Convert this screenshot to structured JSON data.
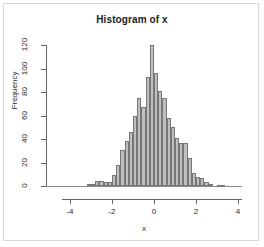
{
  "chart_data": {
    "type": "bar",
    "title": "Histogram of x",
    "xlabel": "x",
    "ylabel": "Frequency",
    "grid": false,
    "legend": "none",
    "xlim": [
      -4,
      4
    ],
    "ylim": [
      0,
      120
    ],
    "x_tick_labels": [
      "-4",
      "-2",
      "0",
      "2",
      "4"
    ],
    "x_tick_values": [
      -4,
      -2,
      0,
      2,
      4
    ],
    "y_tick_labels": [
      "0",
      "20",
      "40",
      "60",
      "80",
      "100",
      "120"
    ],
    "y_tick_values": [
      0,
      20,
      40,
      60,
      80,
      100,
      120
    ],
    "bin_width": 0.2,
    "bin_centers": [
      -3.1,
      -2.9,
      -2.7,
      -2.5,
      -2.3,
      -2.1,
      -1.9,
      -1.7,
      -1.5,
      -1.3,
      -1.1,
      -0.9,
      -0.7,
      -0.5,
      -0.3,
      -0.1,
      0.1,
      0.3,
      0.5,
      0.7,
      0.9,
      1.1,
      1.3,
      1.5,
      1.7,
      1.9,
      2.1,
      2.3,
      2.5,
      2.7,
      2.9,
      3.1,
      3.3
    ],
    "categories": [
      "-3.1",
      "-2.9",
      "-2.7",
      "-2.5",
      "-2.3",
      "-2.1",
      "-1.9",
      "-1.7",
      "-1.5",
      "-1.3",
      "-1.1",
      "-0.9",
      "-0.7",
      "-0.5",
      "-0.3",
      "-0.1",
      "0.1",
      "0.3",
      "0.5",
      "0.7",
      "0.9",
      "1.1",
      "1.3",
      "1.5",
      "1.7",
      "1.9",
      "2.1",
      "2.3",
      "2.5",
      "2.7",
      "2.9",
      "3.1",
      "3.3"
    ],
    "values": [
      2,
      2,
      4,
      4,
      3,
      3,
      9,
      18,
      31,
      38,
      46,
      60,
      75,
      67,
      93,
      120,
      96,
      81,
      75,
      58,
      50,
      41,
      37,
      37,
      24,
      11,
      8,
      7,
      3,
      2,
      0,
      1,
      1
    ],
    "bar_fill_color": "#bfbfbf",
    "bar_border_color": "#777777",
    "axis_color": "#666666",
    "text_color": "#2b2b2b",
    "background_color": "#ffffff",
    "frame_color": "#d8d8d8"
  }
}
